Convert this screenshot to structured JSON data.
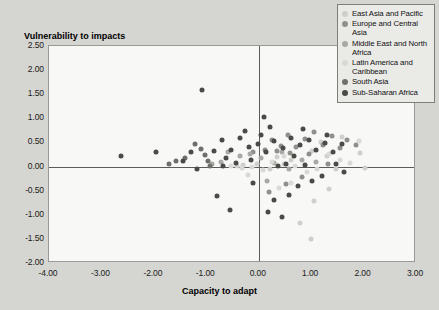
{
  "chart_data": {
    "type": "scatter",
    "title": "",
    "ylabel": "Vulnerability to impacts",
    "xlabel": "Capacity to adapt",
    "xlim": [
      -4.0,
      3.0
    ],
    "ylim": [
      -2.0,
      2.5
    ],
    "xticks": [
      "-4.00",
      "-3.00",
      "-2.00",
      "-1.00",
      "0.00",
      "1.00",
      "2.00",
      "3.00"
    ],
    "xtick_values": [
      -4,
      -3,
      -2,
      -1,
      0,
      1,
      2,
      3
    ],
    "yticks": [
      "2.50",
      "2.00",
      "1.50",
      "1.00",
      "0.50",
      "0.00",
      "-0.50",
      "-1.00",
      "-1.50",
      "-2.00"
    ],
    "ytick_values": [
      2.5,
      2.0,
      1.5,
      1.0,
      0.5,
      0.0,
      -0.5,
      -1.0,
      -1.5,
      -2.0
    ],
    "grid": false,
    "legend_position": "top-right",
    "zero_lines": true,
    "series": [
      {
        "name": "East Asia and Pacific",
        "color": "#cfcfcb",
        "points": [
          [
            1.02,
            0.33
          ],
          [
            1.18,
            0.5
          ],
          [
            1.3,
            0.22
          ],
          [
            1.47,
            -0.06
          ],
          [
            1.58,
            0.62
          ],
          [
            1.93,
            0.29
          ],
          [
            2.02,
            -0.02
          ],
          [
            0.62,
            0.13
          ],
          [
            0.48,
            0.05
          ],
          [
            0.21,
            -0.05
          ],
          [
            -0.04,
            0.05
          ],
          [
            -0.3,
            0.04
          ],
          [
            -0.42,
            0.02
          ],
          [
            1.35,
            -0.46
          ],
          [
            1.05,
            -0.72
          ],
          [
            0.79,
            -1.18
          ],
          [
            1.0,
            -1.5
          ],
          [
            1.72,
            2.05
          ],
          [
            0.35,
            0.2
          ]
        ]
      },
      {
        "name": "Europe and Central Asia",
        "color": "#8f8f8b",
        "points": [
          [
            0.25,
            0.55
          ],
          [
            0.42,
            0.42
          ],
          [
            0.55,
            0.66
          ],
          [
            0.72,
            0.4
          ],
          [
            0.88,
            0.58
          ],
          [
            1.06,
            0.72
          ],
          [
            1.22,
            0.45
          ],
          [
            1.4,
            0.63
          ],
          [
            1.55,
            0.38
          ],
          [
            1.68,
            0.56
          ],
          [
            0.96,
            0.27
          ],
          [
            0.6,
            0.28
          ],
          [
            0.35,
            0.33
          ],
          [
            0.12,
            0.35
          ],
          [
            -0.1,
            0.3
          ],
          [
            1.85,
            0.44
          ],
          [
            1.32,
            0.05
          ],
          [
            0.82,
            -0.22
          ],
          [
            0.52,
            -0.36
          ],
          [
            0.2,
            -0.52
          ]
        ]
      },
      {
        "name": "Middle East and North Africa",
        "color": "#a8a8a4",
        "points": [
          [
            -0.58,
            0.3
          ],
          [
            -0.35,
            0.22
          ],
          [
            -0.16,
            0.26
          ],
          [
            0.05,
            0.18
          ],
          [
            0.3,
            0.08
          ],
          [
            0.58,
            -0.05
          ],
          [
            0.82,
            0.14
          ],
          [
            -0.72,
            0.1
          ],
          [
            -0.9,
            0.05
          ],
          [
            0.45,
            0.3
          ],
          [
            1.1,
            0.1
          ],
          [
            0.15,
            -0.3
          ]
        ]
      },
      {
        "name": "Latin America and Caribbean",
        "color": "#d9d9d6",
        "points": [
          [
            -0.52,
            0.02
          ],
          [
            -0.32,
            -0.02
          ],
          [
            -0.12,
            0.0
          ],
          [
            0.08,
            -0.08
          ],
          [
            0.26,
            0.1
          ],
          [
            0.48,
            0.22
          ],
          [
            0.7,
            0.02
          ],
          [
            0.92,
            -0.12
          ],
          [
            1.12,
            -0.06
          ],
          [
            1.34,
            0.26
          ],
          [
            1.55,
            0.14
          ],
          [
            0.62,
            -0.34
          ],
          [
            0.38,
            -0.45
          ],
          [
            -0.2,
            -0.18
          ],
          [
            1.75,
            0.08
          ],
          [
            1.92,
            0.52
          ]
        ]
      },
      {
        "name": "South Asia",
        "color": "#6e6e6a",
        "points": [
          [
            -1.22,
            0.46
          ],
          [
            -1.1,
            0.36
          ],
          [
            -1.02,
            0.24
          ],
          [
            -0.96,
            0.12
          ],
          [
            -0.92,
            0.02
          ],
          [
            -1.4,
            0.18
          ],
          [
            -1.58,
            0.12
          ],
          [
            -1.72,
            0.06
          ]
        ]
      },
      {
        "name": "Sub-Saharan Africa",
        "color": "#4a4a47",
        "points": [
          [
            -2.62,
            0.22
          ],
          [
            -1.95,
            0.3
          ],
          [
            -1.45,
            0.12
          ],
          [
            -1.08,
            1.58
          ],
          [
            -0.86,
            0.33
          ],
          [
            -0.7,
            0.56
          ],
          [
            -0.52,
            0.34
          ],
          [
            -0.35,
            0.6
          ],
          [
            -0.18,
            0.4
          ],
          [
            -0.02,
            0.46
          ],
          [
            0.14,
            0.3
          ],
          [
            0.3,
            0.52
          ],
          [
            0.46,
            0.38
          ],
          [
            0.62,
            0.6
          ],
          [
            0.78,
            0.44
          ],
          [
            0.95,
            0.55
          ],
          [
            1.1,
            0.34
          ],
          [
            1.26,
            0.48
          ],
          [
            1.42,
            0.3
          ],
          [
            1.58,
            0.46
          ],
          [
            0.05,
            0.66
          ],
          [
            -0.26,
            0.74
          ],
          [
            0.22,
            0.82
          ],
          [
            0.68,
            0.22
          ],
          [
            -0.62,
            0.18
          ],
          [
            -0.44,
            0.08
          ],
          [
            -0.14,
            0.14
          ],
          [
            0.36,
            0.02
          ],
          [
            0.52,
            0.05
          ],
          [
            -1.18,
            -0.05
          ],
          [
            -0.8,
            -0.62
          ],
          [
            0.88,
            0.04
          ],
          [
            1.02,
            -0.3
          ],
          [
            1.2,
            -0.2
          ],
          [
            0.74,
            -0.4
          ],
          [
            0.58,
            -0.58
          ],
          [
            0.3,
            -0.7
          ],
          [
            -0.1,
            -0.34
          ],
          [
            0.18,
            -0.95
          ],
          [
            -0.55,
            -0.9
          ],
          [
            1.48,
            0.05
          ],
          [
            1.62,
            -0.12
          ],
          [
            0.44,
            -1.05
          ],
          [
            -0.68,
            0.02
          ],
          [
            -1.3,
            0.3
          ],
          [
            0.1,
            1.02
          ],
          [
            0.84,
            0.78
          ],
          [
            1.3,
            0.66
          ]
        ]
      }
    ]
  },
  "legend": {
    "items": [
      {
        "label": "East Asia and Pacific",
        "color": "#cfcfcb"
      },
      {
        "label": "Europe and Central Asia",
        "color": "#8f8f8b"
      },
      {
        "label": "Middle East and North Africa",
        "color": "#a8a8a4"
      },
      {
        "label": "Latin America and Caribbean",
        "color": "#d9d9d6"
      },
      {
        "label": "South Asia",
        "color": "#6e6e6a"
      },
      {
        "label": "Sub-Saharan Africa",
        "color": "#4a4a47"
      }
    ]
  }
}
